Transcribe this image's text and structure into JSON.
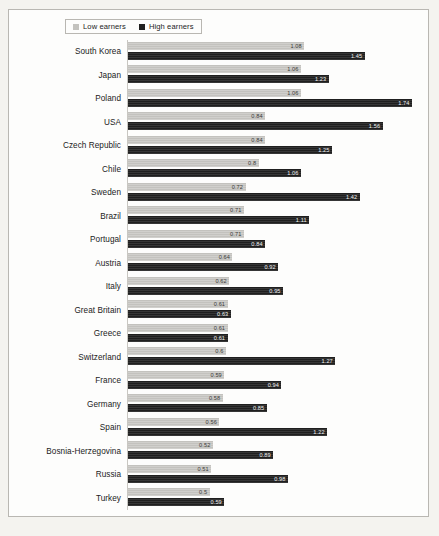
{
  "legend": {
    "items": [
      {
        "label": "Low earners",
        "color": "#c3c2be",
        "key": "low"
      },
      {
        "label": "High earners",
        "color": "#1f1f1f",
        "key": "high"
      }
    ]
  },
  "chart_data": {
    "type": "bar",
    "orientation": "horizontal",
    "title": "",
    "subtitle": "",
    "xlabel": "",
    "ylabel": "",
    "grid": false,
    "legend_position": "top-left",
    "xlim": [
      0,
      1.85
    ],
    "categories": [
      "South Korea",
      "Japan",
      "Poland",
      "USA",
      "Czech Republic",
      "Chile",
      "Sweden",
      "Brazil",
      "Portugal",
      "Austria",
      "Italy",
      "Great Britain",
      "Greece",
      "Switzerland",
      "France",
      "Germany",
      "Spain",
      "Bosnia-Herzegovina",
      "Russia",
      "Turkey"
    ],
    "series": [
      {
        "name": "Low earners",
        "color": "#c3c2be",
        "values": [
          1.08,
          1.06,
          1.06,
          0.84,
          0.84,
          0.8,
          0.72,
          0.71,
          0.71,
          0.64,
          0.62,
          0.61,
          0.61,
          0.6,
          0.59,
          0.58,
          0.56,
          0.52,
          0.51,
          0.5
        ],
        "labels": [
          "1.08",
          "1.06",
          "1.06",
          "0.84",
          "0.84",
          "0.8",
          "0.72",
          "0.71",
          "0.71",
          "0.64",
          "0.62",
          "0.61",
          "0.61",
          "0.6",
          "0.59",
          "0.58",
          "0.56",
          "0.52",
          "0.51",
          "0.5"
        ]
      },
      {
        "name": "High earners",
        "color": "#1f1f1f",
        "values": [
          1.45,
          1.23,
          1.74,
          1.56,
          1.25,
          1.06,
          1.42,
          1.11,
          0.84,
          0.92,
          0.95,
          0.63,
          0.61,
          1.27,
          0.94,
          0.85,
          1.22,
          0.89,
          0.98,
          0.59
        ],
        "labels": [
          "1.45",
          "1.23",
          "1.74",
          "1.56",
          "1.25",
          "1.06",
          "1.42",
          "1.11",
          "0.84",
          "0.92",
          "0.95",
          "0.63",
          "0.61",
          "1.27",
          "0.94",
          "0.85",
          "1.22",
          "0.89",
          "0.98",
          "0.59"
        ]
      }
    ]
  }
}
